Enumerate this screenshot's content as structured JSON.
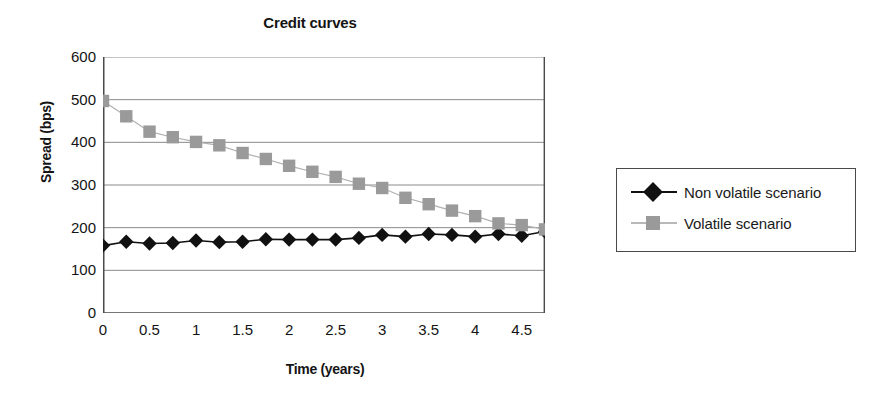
{
  "chart_data": {
    "type": "line",
    "title": "Credit curves",
    "xlabel": "Time (years)",
    "ylabel": "Spread (bps)",
    "xlim": [
      0,
      4.75
    ],
    "ylim": [
      0,
      600
    ],
    "grid": true,
    "grid_axis": "y",
    "legend_position": "right-outside",
    "x_ticks": [
      0,
      0.5,
      1,
      1.5,
      2,
      2.5,
      3,
      3.5,
      4,
      4.5
    ],
    "x_tick_labels": [
      "0",
      "0.5",
      "1",
      "1.5",
      "2",
      "2.5",
      "3",
      "3.5",
      "4",
      "4.5"
    ],
    "x_minor_tick_step": 0.25,
    "y_ticks": [
      0,
      100,
      200,
      300,
      400,
      500,
      600
    ],
    "y_tick_labels": [
      "0",
      "100",
      "200",
      "300",
      "400",
      "500",
      "600"
    ],
    "x": [
      0,
      0.25,
      0.5,
      0.75,
      1,
      1.25,
      1.5,
      1.75,
      2,
      2.25,
      2.5,
      2.75,
      3,
      3.25,
      3.5,
      3.75,
      4,
      4.25,
      4.5,
      4.75
    ],
    "series": [
      {
        "name": "Non volatile scenario",
        "marker": "diamond",
        "color": "#111111",
        "line_color": "#111111",
        "values": [
          158,
          167,
          163,
          164,
          170,
          166,
          167,
          173,
          172,
          172,
          172,
          176,
          183,
          179,
          185,
          183,
          179,
          185,
          181,
          191
        ]
      },
      {
        "name": "Volatile scenario",
        "marker": "square",
        "color": "#9a9a9a",
        "line_color": "#b0b0b0",
        "values": [
          497,
          461,
          425,
          412,
          401,
          393,
          375,
          361,
          345,
          331,
          319,
          303,
          293,
          270,
          255,
          240,
          227,
          210,
          206,
          196
        ]
      }
    ]
  },
  "legend": {
    "items": [
      {
        "label": "Non volatile scenario"
      },
      {
        "label": "Volatile scenario"
      }
    ]
  }
}
